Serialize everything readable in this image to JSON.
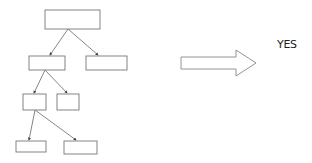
{
  "diagram": {
    "type": "tree",
    "nodes": [
      {
        "id": "root",
        "label": "",
        "x": 45,
        "y": 10,
        "w": 55,
        "h": 19
      },
      {
        "id": "l2a",
        "label": "",
        "x": 29,
        "y": 56,
        "w": 36,
        "h": 14
      },
      {
        "id": "l2b",
        "label": "",
        "x": 86,
        "y": 56,
        "w": 41,
        "h": 14
      },
      {
        "id": "l3a",
        "label": "",
        "x": 23,
        "y": 94,
        "w": 23,
        "h": 16
      },
      {
        "id": "l3b",
        "label": "",
        "x": 57,
        "y": 94,
        "w": 22,
        "h": 16
      },
      {
        "id": "l4a",
        "label": "",
        "x": 16,
        "y": 141,
        "w": 30,
        "h": 11
      },
      {
        "id": "l4b",
        "label": "",
        "x": 64,
        "y": 141,
        "w": 33,
        "h": 13
      }
    ],
    "edges": [
      {
        "from": "root",
        "to": "l2a"
      },
      {
        "from": "root",
        "to": "l2b"
      },
      {
        "from": "l2a",
        "to": "l3a"
      },
      {
        "from": "l2a",
        "to": "l3b"
      },
      {
        "from": "l3a",
        "to": "l4a"
      },
      {
        "from": "l3a",
        "to": "l4b"
      }
    ],
    "arrow": {
      "direction": "right"
    },
    "result_label": "YES"
  }
}
